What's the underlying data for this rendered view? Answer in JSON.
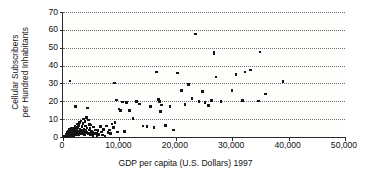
{
  "chart_data": {
    "type": "scatter",
    "title": "",
    "xlabel": "GDP per capita (U.S. Dollars) 1997",
    "ylabel_line1": "Cellular Subscribers",
    "ylabel_line2": "per Hundred Inhabitants",
    "xlim": [
      0,
      50000
    ],
    "ylim": [
      0,
      70
    ],
    "xticks": [
      0,
      10000,
      20000,
      30000,
      40000,
      50000
    ],
    "xticklabels": [
      "0",
      "10,000",
      "20,000",
      "30,000",
      "40,000",
      "50,000"
    ],
    "yticks": [
      0,
      10,
      20,
      30,
      40,
      50,
      60,
      70
    ],
    "yticklabels": [
      "0",
      "10",
      "20",
      "30",
      "40",
      "50",
      "60",
      "70"
    ],
    "grid": "horizontal-dotted",
    "legend": "none",
    "marker_color": "#141414",
    "axis_color": "#2a2a2a",
    "grid_color": "#6e6e6e",
    "background_color": "#fdfdfb",
    "points": [
      [
        300,
        0.2
      ],
      [
        380,
        0.4
      ],
      [
        420,
        0.1
      ],
      [
        450,
        0.6
      ],
      [
        480,
        0.3
      ],
      [
        520,
        0.9
      ],
      [
        560,
        0.2
      ],
      [
        590,
        1.1
      ],
      [
        620,
        0.5
      ],
      [
        650,
        1.4
      ],
      [
        680,
        0.3
      ],
      [
        700,
        2.0
      ],
      [
        720,
        0.8
      ],
      [
        760,
        1.6
      ],
      [
        790,
        0.4
      ],
      [
        810,
        2.6
      ],
      [
        840,
        1.0
      ],
      [
        870,
        0.6
      ],
      [
        900,
        3.1
      ],
      [
        930,
        1.3
      ],
      [
        960,
        0.7
      ],
      [
        990,
        2.2
      ],
      [
        1020,
        0.9
      ],
      [
        1050,
        4.2
      ],
      [
        1080,
        1.5
      ],
      [
        1120,
        0.5
      ],
      [
        1150,
        2.8
      ],
      [
        1180,
        1.1
      ],
      [
        1210,
        31.3
      ],
      [
        1240,
        0.8
      ],
      [
        1280,
        3.4
      ],
      [
        1310,
        1.7
      ],
      [
        1350,
        0.6
      ],
      [
        1390,
        2.4
      ],
      [
        1420,
        1.2
      ],
      [
        1460,
        4.6
      ],
      [
        1500,
        0.9
      ],
      [
        1540,
        2.0
      ],
      [
        1580,
        1.4
      ],
      [
        1620,
        3.7
      ],
      [
        1660,
        0.7
      ],
      [
        1700,
        5.1
      ],
      [
        1740,
        1.8
      ],
      [
        1780,
        2.6
      ],
      [
        1820,
        1.1
      ],
      [
        1870,
        3.2
      ],
      [
        1900,
        0.9
      ],
      [
        1950,
        4.1
      ],
      [
        2000,
        1.6
      ],
      [
        2050,
        2.3
      ],
      [
        2100,
        6.0
      ],
      [
        2150,
        1.2
      ],
      [
        2200,
        3.6
      ],
      [
        2250,
        17.2
      ],
      [
        2300,
        2.1
      ],
      [
        2350,
        4.8
      ],
      [
        2400,
        1.5
      ],
      [
        2450,
        7.2
      ],
      [
        2500,
        2.9
      ],
      [
        2560,
        1.8
      ],
      [
        2620,
        5.4
      ],
      [
        2680,
        3.1
      ],
      [
        2740,
        1.3
      ],
      [
        2800,
        6.6
      ],
      [
        2860,
        2.5
      ],
      [
        2920,
        8.1
      ],
      [
        2980,
        1.9
      ],
      [
        3040,
        4.3
      ],
      [
        3100,
        3.0
      ],
      [
        3160,
        2.2
      ],
      [
        3220,
        9.0
      ],
      [
        3280,
        1.6
      ],
      [
        3340,
        5.9
      ],
      [
        3400,
        3.8
      ],
      [
        3460,
        2.7
      ],
      [
        3520,
        7.7
      ],
      [
        3580,
        2.0
      ],
      [
        3640,
        10.1
      ],
      [
        3700,
        4.4
      ],
      [
        3760,
        3.3
      ],
      [
        3830,
        1.4
      ],
      [
        3900,
        8.6
      ],
      [
        3960,
        2.4
      ],
      [
        4020,
        6.2
      ],
      [
        4090,
        3.5
      ],
      [
        4150,
        10.8
      ],
      [
        4220,
        2.8
      ],
      [
        4290,
        5.0
      ],
      [
        4360,
        16.2
      ],
      [
        4420,
        1.7
      ],
      [
        4500,
        9.5
      ],
      [
        4580,
        3.9
      ],
      [
        4660,
        2.3
      ],
      [
        4740,
        7.0
      ],
      [
        4820,
        4.6
      ],
      [
        4900,
        1.1
      ],
      [
        5000,
        6.8
      ],
      [
        5100,
        3.2
      ],
      [
        5200,
        2.6
      ],
      [
        5300,
        0.9
      ],
      [
        5450,
        5.5
      ],
      [
        5600,
        1.9
      ],
      [
        5750,
        4.0
      ],
      [
        5900,
        2.2
      ],
      [
        6050,
        0.8
      ],
      [
        6200,
        3.6
      ],
      [
        6400,
        1.5
      ],
      [
        6600,
        5.8
      ],
      [
        6800,
        2.9
      ],
      [
        7000,
        1.2
      ],
      [
        7200,
        4.3
      ],
      [
        7450,
        0.6
      ],
      [
        7700,
        6.1
      ],
      [
        7950,
        2.4
      ],
      [
        8200,
        3.9
      ],
      [
        8450,
        1.8
      ],
      [
        8700,
        7.3
      ],
      [
        8950,
        5.2
      ],
      [
        9100,
        30.3
      ],
      [
        9250,
        8.0
      ],
      [
        9500,
        20.8
      ],
      [
        9700,
        2.8
      ],
      [
        9900,
        15.6
      ],
      [
        10200,
        15.0
      ],
      [
        10500,
        19.7
      ],
      [
        10900,
        3.0
      ],
      [
        11300,
        19.4
      ],
      [
        11800,
        14.8
      ],
      [
        12400,
        10.4
      ],
      [
        13000,
        19.8
      ],
      [
        13600,
        18.4
      ],
      [
        14200,
        6.2
      ],
      [
        14900,
        5.8
      ],
      [
        15500,
        17.1
      ],
      [
        16100,
        5.4
      ],
      [
        16600,
        36.3
      ],
      [
        16900,
        21.0
      ],
      [
        17100,
        20.0
      ],
      [
        17300,
        14.4
      ],
      [
        17500,
        18.0
      ],
      [
        18200,
        6.5
      ],
      [
        19000,
        17.2
      ],
      [
        19600,
        4.0
      ],
      [
        20300,
        35.9
      ],
      [
        21000,
        26.0
      ],
      [
        21600,
        18.3
      ],
      [
        22300,
        29.5
      ],
      [
        22900,
        21.5
      ],
      [
        23500,
        57.6
      ],
      [
        24100,
        19.8
      ],
      [
        24700,
        25.5
      ],
      [
        25200,
        19.2
      ],
      [
        25800,
        17.5
      ],
      [
        26300,
        20.6
      ],
      [
        26800,
        46.9
      ],
      [
        26800,
        47.4
      ],
      [
        27100,
        33.6
      ],
      [
        28000,
        20.0
      ],
      [
        30000,
        26.0
      ],
      [
        30700,
        34.9
      ],
      [
        31800,
        20.5
      ],
      [
        32300,
        36.3
      ],
      [
        33200,
        37.6
      ],
      [
        34700,
        20.1
      ],
      [
        34900,
        47.7
      ],
      [
        35900,
        24.0
      ],
      [
        39000,
        31.2
      ]
    ]
  }
}
